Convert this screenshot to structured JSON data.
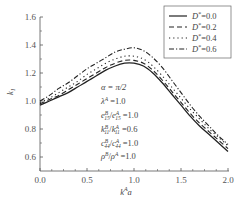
{
  "chart_data": {
    "type": "line",
    "title": "",
    "xlabel": "k^A a",
    "ylabel": "k_1",
    "xlim": [
      0.0,
      2.0
    ],
    "ylim": [
      0.5,
      1.6
    ],
    "xticks": [
      0.0,
      0.5,
      1.0,
      1.5,
      2.0
    ],
    "xtick_labels": [
      "0.0",
      "0.5",
      "1.0",
      "1.5",
      "2.0"
    ],
    "yticks": [
      0.6,
      0.8,
      1.0,
      1.2,
      1.4,
      1.6
    ],
    "ytick_labels": [
      "0.6",
      "0.8",
      "1.0",
      "1.2",
      "1.4",
      "1.6"
    ],
    "grid": false,
    "legend_position": "upper right",
    "x": [
      0.0,
      0.1,
      0.2,
      0.3,
      0.4,
      0.5,
      0.6,
      0.7,
      0.8,
      0.9,
      1.0,
      1.1,
      1.2,
      1.3,
      1.4,
      1.5,
      1.6,
      1.7,
      1.8,
      1.9,
      2.0
    ],
    "series": [
      {
        "name": "D*=0.0",
        "style": "solid",
        "values": [
          0.97,
          1.0,
          1.03,
          1.06,
          1.1,
          1.14,
          1.18,
          1.22,
          1.25,
          1.27,
          1.27,
          1.25,
          1.2,
          1.13,
          1.05,
          0.97,
          0.89,
          0.82,
          0.76,
          0.7,
          0.64
        ]
      },
      {
        "name": "D*=0.2",
        "style": "dashed",
        "values": [
          0.98,
          1.01,
          1.04,
          1.08,
          1.12,
          1.16,
          1.2,
          1.24,
          1.27,
          1.29,
          1.29,
          1.27,
          1.22,
          1.15,
          1.07,
          0.99,
          0.91,
          0.84,
          0.78,
          0.72,
          0.66
        ]
      },
      {
        "name": "D*=0.4",
        "style": "dotted",
        "values": [
          0.99,
          1.02,
          1.06,
          1.1,
          1.14,
          1.19,
          1.23,
          1.27,
          1.3,
          1.32,
          1.32,
          1.3,
          1.25,
          1.18,
          1.1,
          1.02,
          0.94,
          0.87,
          0.8,
          0.74,
          0.68
        ]
      },
      {
        "name": "D*=0.6",
        "style": "dashdot",
        "values": [
          1.0,
          1.04,
          1.09,
          1.13,
          1.18,
          1.23,
          1.27,
          1.31,
          1.35,
          1.37,
          1.38,
          1.36,
          1.31,
          1.24,
          1.15,
          1.06,
          0.97,
          0.89,
          0.82,
          0.75,
          0.69
        ]
      }
    ],
    "annotations": [
      "α = π/2",
      "λ^A = 1.0",
      "e15^B/e15^A = 1.0",
      "k11^B/k11^A = 0.6",
      "c44^B/c44^A = 1.0",
      "ρ^B/ρ^A = 1.0"
    ]
  },
  "labels": {
    "ylabel_main": "k",
    "ylabel_sub": "1",
    "xlabel_main": "k",
    "xlabel_sup": "A",
    "xlabel_tail": "a",
    "legend": [
      {
        "pre": "D",
        "sup": "*",
        "post": "=0.0"
      },
      {
        "pre": "D",
        "sup": "*",
        "post": "=0.2"
      },
      {
        "pre": "D",
        "sup": "*",
        "post": "=0.4"
      },
      {
        "pre": "D",
        "sup": "*",
        "post": "=0.6"
      }
    ],
    "ann": {
      "alpha": "α = π/2",
      "lambda_main": "λ",
      "lambda_sup": "A",
      "lambda_val": " =1.0",
      "e_main": "e",
      "e_sub": "15",
      "e_supB": "B",
      "e_supA": "A",
      "e_val": " =1.0",
      "k_main": "k",
      "k_sub": "11",
      "k_val": " =0.6",
      "c_main": "c",
      "c_sub": "44",
      "c_val": " =1.0",
      "rho_main": "ρ",
      "rho_val": " =1.0",
      "B": "B",
      "A": "A",
      "slash": "/"
    }
  }
}
